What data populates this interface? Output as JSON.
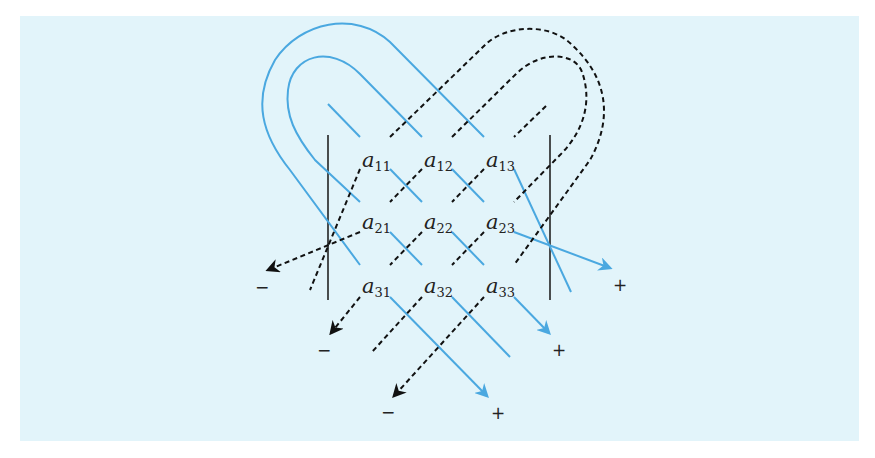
{
  "diagram": {
    "colors": {
      "background": "#e2f4fa",
      "positive_diagonal": "#4aa8e0",
      "negative_diagonal": "#111111",
      "bars": "#222222"
    },
    "matrix": {
      "symbol": "a",
      "entries": [
        [
          {
            "sym": "a",
            "sub": "11"
          },
          {
            "sym": "a",
            "sub": "12"
          },
          {
            "sym": "a",
            "sub": "13"
          }
        ],
        [
          {
            "sym": "a",
            "sub": "21"
          },
          {
            "sym": "a",
            "sub": "22"
          },
          {
            "sym": "a",
            "sub": "23"
          }
        ],
        [
          {
            "sym": "a",
            "sub": "31"
          },
          {
            "sym": "a",
            "sub": "32"
          },
          {
            "sym": "a",
            "sub": "33"
          }
        ]
      ]
    },
    "signs": {
      "positive": [
        "+",
        "+",
        "+"
      ],
      "negative": [
        "−",
        "−",
        "−"
      ]
    },
    "legend": {
      "solid_blue": "positive products (+)",
      "dashed_black": "negative products (−)"
    }
  }
}
